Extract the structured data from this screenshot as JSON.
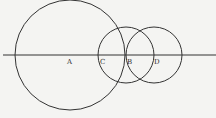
{
  "diagram": {
    "type": "geometric-construction",
    "background": "#f4f4f2",
    "stroke_color": "#333333",
    "line": {
      "x1": 3,
      "y1": 55,
      "x2": 216,
      "y2": 55
    },
    "circles": [
      {
        "name": "circle-a",
        "cx": 70,
        "cy": 55,
        "r": 55
      },
      {
        "name": "circle-b",
        "cx": 126,
        "cy": 55,
        "r": 28
      },
      {
        "name": "circle-d",
        "cx": 154,
        "cy": 55,
        "r": 28
      }
    ],
    "points": [
      {
        "label": "A",
        "x": 70,
        "y": 55,
        "lx": 67,
        "ly": 64
      },
      {
        "label": "C",
        "x": 98,
        "y": 55,
        "lx": 100,
        "ly": 64
      },
      {
        "label": "B",
        "x": 126,
        "y": 55,
        "lx": 127,
        "ly": 64
      },
      {
        "label": "D",
        "x": 154,
        "y": 55,
        "lx": 154,
        "ly": 64
      }
    ]
  }
}
